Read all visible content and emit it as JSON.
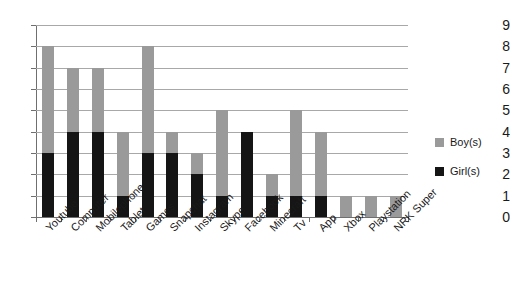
{
  "chart_data": {
    "type": "bar",
    "title": "",
    "subtitle": "",
    "xlabel": "",
    "ylabel": "",
    "ylim": [
      0,
      9
    ],
    "ytick_step": 1,
    "yticks": [
      0,
      1,
      2,
      3,
      4,
      5,
      6,
      7,
      8,
      9
    ],
    "grid": true,
    "grid_axis": "y",
    "stacked": true,
    "legend_position": "right",
    "categories": [
      "Youtube",
      "Computer",
      "Mobilephone",
      "Tablet",
      "Games",
      "Snapchat",
      "Instagram",
      "Skype",
      "Facebook",
      "Minecraft",
      "Tv",
      "App",
      "Xbox",
      "Playstation",
      "NRK Super"
    ],
    "series": [
      {
        "name": "Girl(s)",
        "color": "#151515",
        "values": [
          3,
          4,
          4,
          1,
          3,
          3,
          2,
          1,
          4,
          1,
          1,
          1,
          0,
          0,
          0
        ]
      },
      {
        "name": "Boy(s)",
        "color": "#9a9a9a",
        "values": [
          5,
          3,
          3,
          3,
          5,
          1,
          1,
          4,
          0,
          1,
          4,
          3,
          1,
          1,
          1
        ]
      }
    ],
    "totals": [
      8,
      7,
      7,
      4,
      8,
      4,
      3,
      5,
      4,
      2,
      5,
      4,
      1,
      1,
      1
    ]
  },
  "legend": {
    "entries": [
      {
        "label": "Boy(s)",
        "color": "#9a9a9a"
      },
      {
        "label": "Girl(s)",
        "color": "#151515"
      }
    ]
  },
  "colors": {
    "boys": "#9a9a9a",
    "girls": "#151515",
    "gridline": "#a8a8a8",
    "axis": "#6f6f6f",
    "background": "#ffffff",
    "text": "#1a1a1a"
  }
}
